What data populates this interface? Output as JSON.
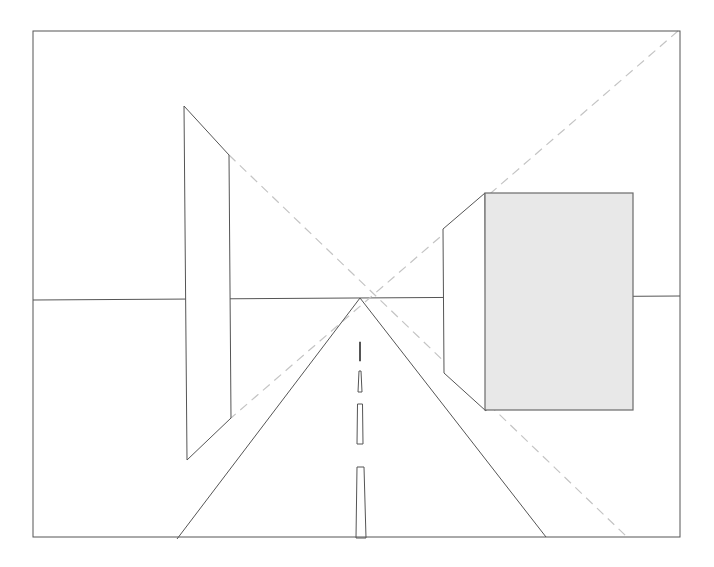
{
  "diagram": {
    "title": "",
    "type": "one-point perspective drawing",
    "colors": {
      "line": "#555555",
      "construction_dashed": "#c4c4c4",
      "box_front_fill": "#e8e8e8",
      "background": "#ffffff"
    },
    "frame": {
      "x1": 33,
      "y1": 31,
      "x2": 680,
      "y2": 537
    },
    "vanishing_point": {
      "x": 360,
      "y": 298
    },
    "horizon": {
      "y_left": 300,
      "y_right": 296
    },
    "left_panel": {
      "points": [
        [
          184,
          106
        ],
        [
          229,
          155
        ],
        [
          231,
          418
        ],
        [
          187,
          460
        ]
      ]
    },
    "right_box": {
      "front": {
        "x1": 485,
        "y1": 193,
        "x2": 633,
        "y2": 410
      },
      "side": {
        "points": [
          [
            443,
            229
          ],
          [
            485,
            193
          ],
          [
            486,
            411
          ],
          [
            444,
            373
          ]
        ]
      }
    },
    "road": {
      "left_edge": [
        [
          360,
          298
        ],
        [
          177,
          539
        ]
      ],
      "right_edge": [
        [
          360,
          298
        ],
        [
          546,
          537
        ]
      ],
      "center_dashes": [
        {
          "points": [
            [
              359.5,
              342
            ],
            [
              360.5,
              342
            ],
            [
              360.5,
              361
            ],
            [
              359.5,
              361
            ]
          ]
        },
        {
          "points": [
            [
              359,
              371
            ],
            [
              361,
              371
            ],
            [
              362,
              392
            ],
            [
              358,
              392
            ]
          ]
        },
        {
          "points": [
            [
              357.5,
              404
            ],
            [
              362.5,
              404
            ],
            [
              363,
              444
            ],
            [
              357,
              444
            ]
          ]
        },
        {
          "points": [
            [
              357,
              467
            ],
            [
              364,
              467
            ],
            [
              366,
              538
            ],
            [
              356,
              538
            ]
          ]
        }
      ]
    },
    "construction_lines": [
      {
        "from": [
          229,
          155
        ],
        "to": [
          626,
          536
        ]
      },
      {
        "from": [
          678,
          31
        ],
        "to": [
          231,
          418
        ]
      }
    ]
  }
}
